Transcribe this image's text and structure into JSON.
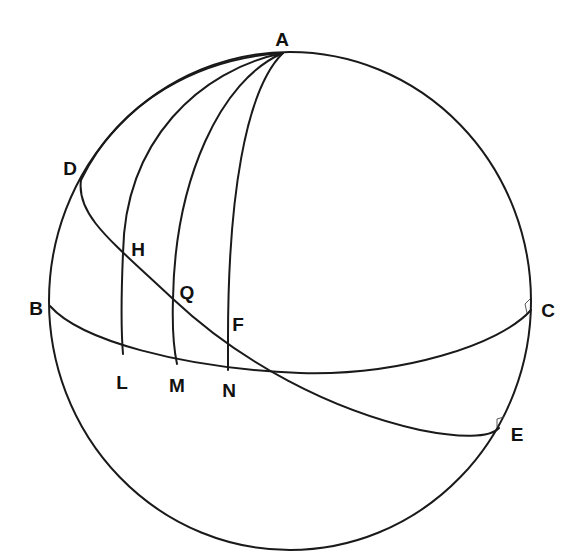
{
  "figure": {
    "colors": {
      "line": "#1a1a1a",
      "label": "#111111",
      "background": "#ffffff"
    },
    "sphere": {
      "cx": 290,
      "cy": 301,
      "rx": 241,
      "ry": 249
    },
    "points": {
      "A": {
        "label": "A",
        "x": 283,
        "y": 53
      },
      "B": {
        "label": "B",
        "x": 50,
        "y": 306
      },
      "C": {
        "label": "C",
        "x": 531,
        "y": 310
      },
      "D": {
        "label": "D",
        "x": 81,
        "y": 180
      },
      "E": {
        "label": "E",
        "x": 499,
        "y": 428
      },
      "H": {
        "label": "H",
        "x": 123,
        "y": 253
      },
      "Q": {
        "label": "Q",
        "x": 173,
        "y": 299
      },
      "F": {
        "label": "F",
        "x": 228,
        "y": 338
      },
      "L": {
        "label": "L",
        "x": 123,
        "y": 354
      },
      "M": {
        "label": "M",
        "x": 177,
        "y": 364
      },
      "N": {
        "label": "N",
        "x": 228,
        "y": 370
      }
    },
    "curves": [
      {
        "name": "great-circle-B-C",
        "from": "B",
        "to": "C"
      },
      {
        "name": "great-circle-D-E",
        "from": "D",
        "to": "E"
      },
      {
        "name": "meridian-A-L",
        "from": "A",
        "to": "L",
        "through": "H"
      },
      {
        "name": "meridian-A-M",
        "from": "A",
        "to": "M",
        "through": "Q"
      },
      {
        "name": "meridian-A-N",
        "from": "A",
        "to": "N",
        "through": "F"
      }
    ],
    "right_angle_markers": [
      "C",
      "E"
    ]
  }
}
